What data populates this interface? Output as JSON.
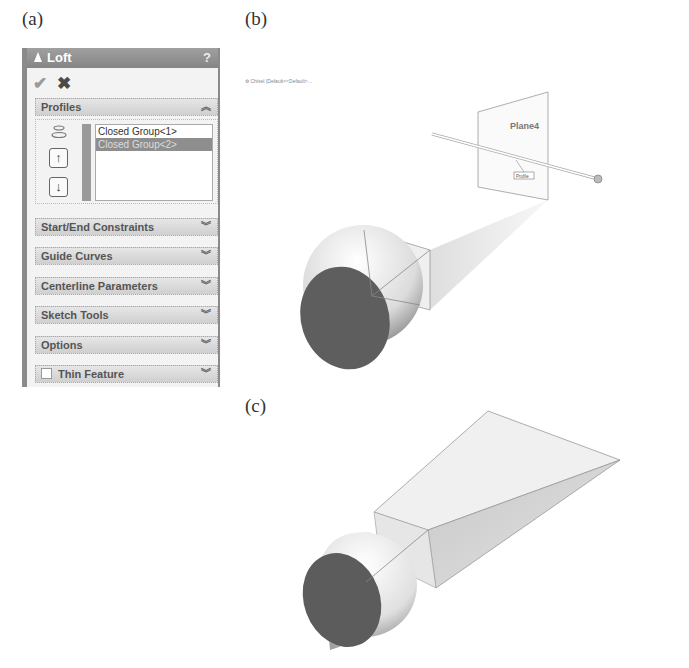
{
  "figure_labels": {
    "a": "(a)",
    "b": "(b)",
    "c": "(c)"
  },
  "property_manager": {
    "title": "Loft",
    "help": "?",
    "ok_icon": "✔",
    "cancel_icon": "✖",
    "groups": [
      {
        "label": "Profiles",
        "state": "expanded",
        "chevron": "⌃⌃"
      },
      {
        "label": "Start/End Constraints",
        "state": "collapsed",
        "chevron": "⌄⌄"
      },
      {
        "label": "Guide Curves",
        "state": "collapsed",
        "chevron": "⌄⌄"
      },
      {
        "label": "Centerline Parameters",
        "state": "collapsed",
        "chevron": "⌄⌄"
      },
      {
        "label": "Sketch Tools",
        "state": "collapsed",
        "chevron": "⌄⌄"
      },
      {
        "label": "Options",
        "state": "collapsed",
        "chevron": "⌄⌄"
      },
      {
        "label": "Thin Feature",
        "state": "collapsed",
        "chevron": "⌄⌄",
        "checkbox": false
      }
    ],
    "profiles": {
      "items": [
        {
          "label": "Closed Group<1>",
          "selected": false
        },
        {
          "label": "Closed Group<2>",
          "selected": true
        }
      ],
      "move_up": "↑",
      "move_down": "↓"
    }
  },
  "viewport_b": {
    "tree_item": "Chisel (Default<<Default>...",
    "plane_label": "Plane4",
    "callout": "Profile"
  },
  "colors": {
    "title_bar": "#8f8f8f",
    "selected_item": "#8e8e8e",
    "face_dark": "#5a5a5a",
    "face_light": "#ececec"
  }
}
